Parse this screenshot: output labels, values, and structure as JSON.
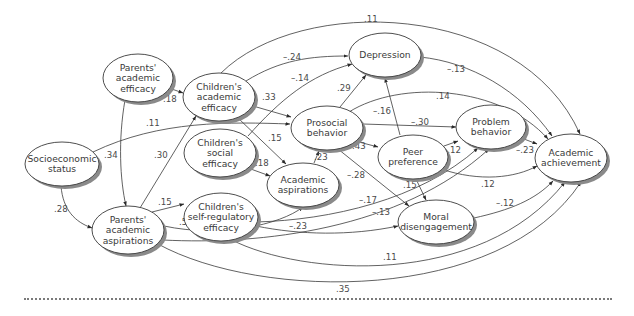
{
  "diagram": {
    "type": "path-diagram",
    "nodes": [
      {
        "id": "pae",
        "lines": [
          "Parents'",
          "academic",
          "efficacy"
        ],
        "cx": 138,
        "cy": 78,
        "rx": 35,
        "ry": 24
      },
      {
        "id": "cae",
        "lines": [
          "Children's",
          "academic",
          "efficacy"
        ],
        "cx": 219,
        "cy": 97,
        "rx": 36,
        "ry": 24
      },
      {
        "id": "dep",
        "lines": [
          "Depression"
        ],
        "cx": 385,
        "cy": 55,
        "rx": 36,
        "ry": 22
      },
      {
        "id": "pro",
        "lines": [
          "Prosocial",
          "behavior"
        ],
        "cx": 327,
        "cy": 128,
        "rx": 36,
        "ry": 22
      },
      {
        "id": "cse",
        "lines": [
          "Children's",
          "social",
          "efficacy"
        ],
        "cx": 220,
        "cy": 153,
        "rx": 36,
        "ry": 24
      },
      {
        "id": "ses",
        "lines": [
          "Socioeconomic",
          "status"
        ],
        "cx": 62,
        "cy": 164,
        "rx": 37,
        "ry": 22
      },
      {
        "id": "asp",
        "lines": [
          "Academic",
          "aspirations"
        ],
        "cx": 303,
        "cy": 185,
        "rx": 36,
        "ry": 22
      },
      {
        "id": "peer",
        "lines": [
          "Peer",
          "preference"
        ],
        "cx": 413,
        "cy": 157,
        "rx": 35,
        "ry": 22
      },
      {
        "id": "prob",
        "lines": [
          "Problem",
          "behavior"
        ],
        "cx": 491,
        "cy": 127,
        "rx": 35,
        "ry": 22
      },
      {
        "id": "ach",
        "lines": [
          "Academic",
          "achievement"
        ],
        "cx": 571,
        "cy": 158,
        "rx": 36,
        "ry": 24
      },
      {
        "id": "csre",
        "lines": [
          "Children's",
          "self-regulatory",
          "efficacy"
        ],
        "cx": 221,
        "cy": 217,
        "rx": 37,
        "ry": 24
      },
      {
        "id": "pasp",
        "lines": [
          "Parents'",
          "academic",
          "aspirations"
        ],
        "cx": 128,
        "cy": 230,
        "rx": 36,
        "ry": 24
      },
      {
        "id": "moral",
        "lines": [
          "Moral",
          "disengagement"
        ],
        "cx": 436,
        "cy": 222,
        "rx": 38,
        "ry": 22
      }
    ],
    "edges": [
      {
        "from": "cae",
        "to": "ach",
        "coef": ".11",
        "d": "M221,73 C300,-5 520,0 580,134",
        "lx": 364,
        "ly": 22
      },
      {
        "from": "cae",
        "to": "dep",
        "coef": "–.24",
        "d": "M246,81 C280,60 310,56 348,56",
        "lx": 283,
        "ly": 60
      },
      {
        "from": "cse",
        "to": "dep",
        "coef": "–.14",
        "d": "M248,136 C280,100 310,75 352,64",
        "lx": 291,
        "ly": 81
      },
      {
        "from": "pae",
        "to": "cae",
        "coef": ".18",
        "d": "M169,88 L183,93",
        "lx": 163,
        "ly": 102
      },
      {
        "from": "cae",
        "to": "pro",
        "coef": ".33",
        "d": "M253,106 L291,117",
        "lx": 262,
        "ly": 100
      },
      {
        "from": "cae",
        "to": "asp",
        "coef": ".15",
        "d": "M238,118 L286,164",
        "lx": 268,
        "ly": 141
      },
      {
        "from": "ses",
        "to": "pro",
        "coef": ".11",
        "d": "M93,152 C160,120 230,122 290,124",
        "lx": 146,
        "ly": 126
      },
      {
        "from": "pae",
        "to": "pasp",
        "coef": ".34",
        "d": "M125,100 C118,140 120,180 126,206",
        "lx": 104,
        "ly": 158
      },
      {
        "from": "pasp",
        "to": "cae",
        "coef": ".30",
        "d": "M140,208 L196,116",
        "lx": 154,
        "ly": 158
      },
      {
        "from": "cse",
        "to": "asp",
        "coef": ".18",
        "d": "M248,168 L270,176",
        "lx": 255,
        "ly": 166
      },
      {
        "from": "asp",
        "to": "pro",
        "coef": ".23",
        "d": "M314,163 L319,151",
        "lx": 314,
        "ly": 160
      },
      {
        "from": "pro",
        "to": "dep",
        "coef": ".29",
        "d": "M340,107 L366,75",
        "lx": 337,
        "ly": 91
      },
      {
        "from": "dep",
        "to": "ach",
        "coef": "–.13",
        "d": "M420,57 C470,62 520,90 552,136",
        "lx": 447,
        "ly": 72
      },
      {
        "from": "pro",
        "to": "ach",
        "coef": ".14",
        "d": "M349,112 C400,80 500,85 548,139",
        "lx": 436,
        "ly": 99
      },
      {
        "from": "peer",
        "to": "dep",
        "coef": "–.16",
        "d": "M400,135 L385,78",
        "lx": 373,
        "ly": 114
      },
      {
        "from": "pro",
        "to": "prob",
        "coef": "–.30",
        "d": "M363,124 L456,127",
        "lx": 411,
        "ly": 125
      },
      {
        "from": "pro",
        "to": "peer",
        "coef": ".43",
        "d": "M355,141 L378,147",
        "lx": 352,
        "ly": 149
      },
      {
        "from": "peer",
        "to": "prob",
        "coef": "–.12",
        "d": "M444,146 L458,141",
        "lx": 443,
        "ly": 153
      },
      {
        "from": "prob",
        "to": "ach",
        "coef": "–.23",
        "d": "M524,139 L537,144",
        "lx": 516,
        "ly": 153
      },
      {
        "from": "peer",
        "to": "ach",
        "coef": ".12",
        "d": "M441,169 C480,182 515,178 537,166",
        "lx": 481,
        "ly": 187
      },
      {
        "from": "pro",
        "to": "moral",
        "coef": "–.28",
        "d": "M338,149 L409,206",
        "lx": 347,
        "ly": 178
      },
      {
        "from": "peer",
        "to": "moral",
        "coef": ".15",
        "d": "M416,179 L426,200",
        "lx": 403,
        "ly": 188
      },
      {
        "from": "csre",
        "to": "prob",
        "coef": "–.17",
        "d": "M256,222 C330,220 420,200 478,148",
        "lx": 359,
        "ly": 203
      },
      {
        "from": "pasp",
        "to": "prob",
        "coef": "–.13",
        "d": "M163,240 C260,245 400,230 489,149",
        "lx": 372,
        "ly": 215
      },
      {
        "from": "pasp",
        "to": "asp",
        "coef": ".54",
        "d": "M164,226 C220,238 280,225 303,207",
        "lx": 179,
        "ly": 225
      },
      {
        "from": "csre",
        "to": "moral",
        "coef": "–.23",
        "d": "M256,226 C300,235 350,236 398,226",
        "lx": 289,
        "ly": 229
      },
      {
        "from": "moral",
        "to": "ach",
        "coef": "–.12",
        "d": "M474,218 C510,210 535,200 553,181",
        "lx": 496,
        "ly": 206
      },
      {
        "from": "csre",
        "to": "ach",
        "coef": ".11",
        "d": "M232,240 C300,275 480,290 565,182",
        "lx": 383,
        "ly": 260
      },
      {
        "from": "pasp",
        "to": "ach",
        "coef": ".35",
        "d": "M158,244 C260,300 500,305 581,182",
        "lx": 336,
        "ly": 292
      },
      {
        "from": "ses",
        "to": "pasp",
        "coef": ".28",
        "d": "M61,186 C63,210 75,222 92,228",
        "lx": 54,
        "ly": 212
      },
      {
        "from": "pasp",
        "to": "csre",
        "coef": ".15",
        "d": "M152,212 L184,204",
        "lx": 158,
        "ly": 205
      }
    ],
    "edge_color": "#3a3a3a",
    "shadow_color": "#8a8a8a",
    "divider": "dotted"
  }
}
